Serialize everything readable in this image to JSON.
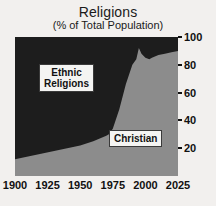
{
  "chart_data": {
    "type": "area",
    "title": "Religions",
    "subtitle": "(% of Total Population)",
    "xlabel": "",
    "ylabel": "",
    "xlim": [
      1900,
      2025
    ],
    "ylim": [
      0,
      100
    ],
    "grid": false,
    "legend_position": "inline-labels",
    "stacked": true,
    "x_ticks": [
      1900,
      1925,
      1950,
      1975,
      2000,
      2025
    ],
    "y_ticks": [
      20,
      40,
      60,
      80,
      100
    ],
    "y_axis_side": "right",
    "colors": {
      "christian": "#8c8c8c",
      "ethnic_religions": "#1d1d1d",
      "background": "#f2f0ee",
      "text": "#111111"
    },
    "x": [
      1900,
      1910,
      1920,
      1930,
      1940,
      1950,
      1960,
      1970,
      1972,
      1975,
      1980,
      1985,
      1990,
      1993,
      1995,
      1997,
      2000,
      2003,
      2005,
      2010,
      2015,
      2020,
      2025
    ],
    "series": [
      {
        "name": "Christian",
        "color": "#8c8c8c",
        "values": [
          12,
          14,
          16,
          18,
          20,
          22,
          25,
          29,
          30,
          34,
          48,
          66,
          80,
          84,
          92,
          88,
          85,
          84,
          85,
          87,
          88,
          89,
          90
        ]
      },
      {
        "name": "Ethnic Religions",
        "color": "#1d1d1d",
        "values": [
          88,
          86,
          84,
          82,
          80,
          78,
          75,
          71,
          70,
          66,
          52,
          34,
          20,
          16,
          8,
          12,
          15,
          16,
          15,
          13,
          12,
          11,
          10
        ]
      }
    ],
    "annotations": [
      {
        "id": "ethnic",
        "text": "Ethnic\nReligions"
      },
      {
        "id": "christian",
        "text": "Christian"
      }
    ]
  },
  "labels": {
    "ethnic": "Ethnic\nReligions",
    "christian": "Christian"
  }
}
